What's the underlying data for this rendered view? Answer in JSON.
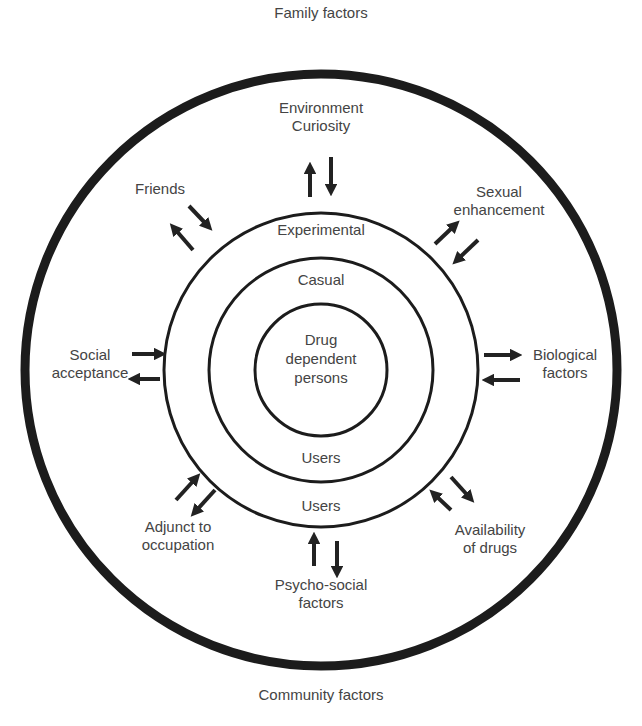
{
  "outer_labels": {
    "top": "Family factors",
    "bottom": "Community factors"
  },
  "rings": {
    "center": "Drug\ndependent\npersons",
    "casual_top": "Casual",
    "casual_bottom": "Users",
    "experimental_top": "Experimental",
    "experimental_bottom": "Users"
  },
  "factors": [
    {
      "id": "environment",
      "label": "Environment\nCuriosity"
    },
    {
      "id": "friends",
      "label": "Friends"
    },
    {
      "id": "sexual",
      "label": "Sexual\nenhancement"
    },
    {
      "id": "social",
      "label": "Social\nacceptance"
    },
    {
      "id": "biological",
      "label": "Biological\nfactors"
    },
    {
      "id": "adjunct",
      "label": "Adjunct to\noccupation"
    },
    {
      "id": "availability",
      "label": "Availability\nof drugs"
    },
    {
      "id": "psycho",
      "label": "Psycho-social\nfactors"
    }
  ]
}
